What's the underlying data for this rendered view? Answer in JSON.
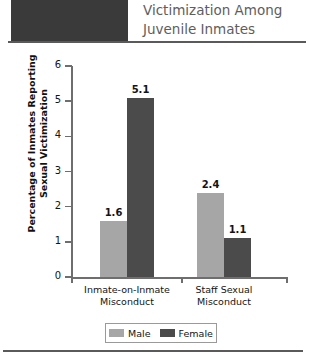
{
  "header": {
    "title_lines": [
      "Victimization Among",
      "Juvenile Inmates"
    ],
    "block_color": "#3a3a3a",
    "rule_color": "#5a5a5a"
  },
  "legend": {
    "items": [
      {
        "label": "Male",
        "color": "#a6a6a6"
      },
      {
        "label": "Female",
        "color": "#4b4b4b"
      }
    ]
  },
  "chart_data": {
    "type": "bar",
    "title": "Victimization Among Juvenile Inmates",
    "xlabel": "",
    "ylabel": "Percentage of Inmates Reporting Sexual Victimization",
    "ylabel_lines": [
      "Percentage of Inmates Reporting",
      "Sexual Victimization"
    ],
    "categories": [
      "Inmate-on-Inmate Misconduct",
      "Staff Sexual Misconduct"
    ],
    "category_lines": [
      [
        "Inmate-on-Inmate",
        "Misconduct"
      ],
      [
        "Staff Sexual",
        "Misconduct"
      ]
    ],
    "series": [
      {
        "name": "Male",
        "color": "#a6a6a6",
        "values": [
          1.6,
          2.4
        ]
      },
      {
        "name": "Female",
        "color": "#4b4b4b",
        "values": [
          5.1,
          1.1
        ]
      }
    ],
    "value_labels": [
      "1.6",
      "5.1",
      "2.4",
      "1.1"
    ],
    "ylim": [
      0,
      6
    ],
    "yticks": [
      0,
      1,
      2,
      3,
      4,
      5,
      6
    ],
    "ytick_labels": [
      "0",
      "1",
      "2",
      "3",
      "4",
      "5",
      "6"
    ],
    "grid": false,
    "legend_position": "bottom"
  }
}
